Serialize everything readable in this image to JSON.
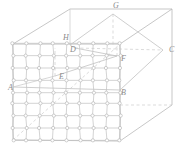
{
  "figure": {
    "background_color": "#ffffff",
    "line_color": "#b9b9b9",
    "mesh_color": "#c4c4c4",
    "dashed_color": "#cccccc",
    "label_color": "#8a8a8a",
    "node_fill": "#ffffff",
    "node_stroke": "#b0b0b0",
    "labels": [
      {
        "id": "label-G",
        "text": "G",
        "x": 113,
        "y": 8
      },
      {
        "id": "label-H",
        "text": "H",
        "x": 63,
        "y": 40
      },
      {
        "id": "label-C",
        "text": "C",
        "x": 169,
        "y": 52
      },
      {
        "id": "label-D",
        "text": "D",
        "x": 70,
        "y": 52
      },
      {
        "id": "label-F",
        "text": "F",
        "x": 121,
        "y": 61
      },
      {
        "id": "label-E",
        "text": "E",
        "x": 59,
        "y": 79
      },
      {
        "id": "label-A",
        "text": "A",
        "x": 8,
        "y": 90
      },
      {
        "id": "label-B",
        "text": "B",
        "x": 121,
        "y": 95
      }
    ],
    "vertices": {
      "A": {
        "x": 13,
        "y": 87
      },
      "B": {
        "x": 120,
        "y": 90
      },
      "C": {
        "x": 163,
        "y": 50
      },
      "D": {
        "x": 75,
        "y": 48
      },
      "E": {
        "x": 55,
        "y": 76
      },
      "F": {
        "x": 117,
        "y": 56
      },
      "G": {
        "x": 113,
        "y": 14
      },
      "H": {
        "x": 70,
        "y": 45
      }
    },
    "outer_box": {
      "front_bottom_left": {
        "x": 13,
        "y": 140
      },
      "front_bottom_right": {
        "x": 120,
        "y": 141
      },
      "front_top_left": {
        "x": 13,
        "y": 44
      },
      "front_top_right": {
        "x": 120,
        "y": 44
      },
      "back_top_left": {
        "x": 70,
        "y": 9
      },
      "back_top_right": {
        "x": 172,
        "y": 9
      },
      "back_bottom_right": {
        "x": 172,
        "y": 105
      }
    },
    "mesh": {
      "columns": 8,
      "rows": 8,
      "x_start": 13,
      "x_end": 120,
      "y_start": 44,
      "y_end": 140,
      "node_radius": 1.6,
      "description": "Front-face lattice of small circular nodes connected by short segments"
    },
    "dashed_lines": [
      {
        "id": "dash-G-down",
        "from": {
          "x": 113,
          "y": 14
        },
        "to": {
          "x": 113,
          "y": 46
        }
      },
      {
        "id": "dash-D-F",
        "from": {
          "x": 75,
          "y": 48
        },
        "to": {
          "x": 163,
          "y": 50
        }
      },
      {
        "id": "dash-H-D",
        "from": {
          "x": 70,
          "y": 45
        },
        "to": {
          "x": 75,
          "y": 48
        }
      },
      {
        "id": "dash-B-back",
        "from": {
          "x": 120,
          "y": 105
        },
        "to": {
          "x": 172,
          "y": 105
        }
      },
      {
        "id": "dash-A-E-diag",
        "from": {
          "x": 13,
          "y": 140
        },
        "to": {
          "x": 120,
          "y": 44
        }
      }
    ]
  }
}
